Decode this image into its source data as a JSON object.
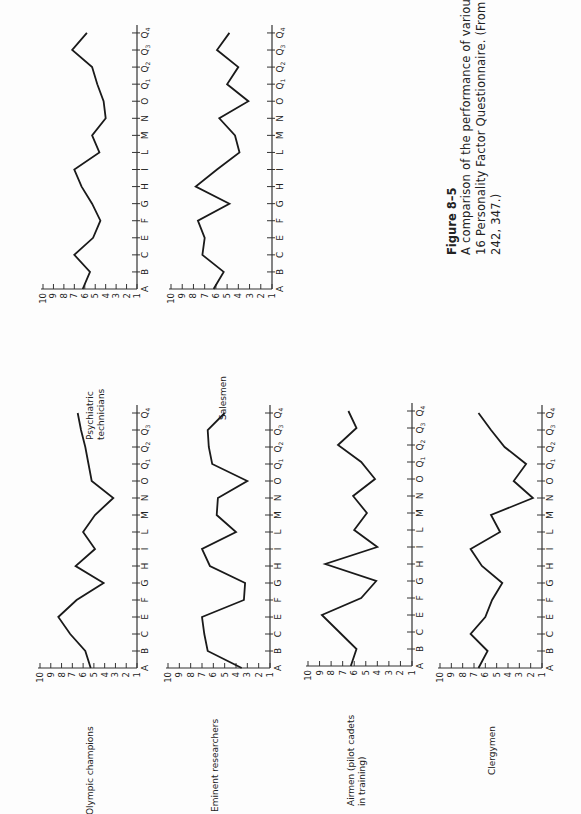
{
  "figure": {
    "label": "Figure 8–5",
    "caption_lines": [
      "A comparison of the performance of various groups on the",
      "16 Personality Factor Questionnaire. (From Cattell 1965, p.",
      "242, 347.)"
    ]
  },
  "chart_data": [
    {
      "type": "line",
      "title": "Psychiatric technicians",
      "categories": [
        "A",
        "B",
        "C",
        "E",
        "F",
        "G",
        "H",
        "I",
        "L",
        "M",
        "N",
        "O",
        "Q1",
        "Q2",
        "Q3",
        "Q4"
      ],
      "values": [
        6.2,
        5.5,
        7.0,
        5.2,
        4.5,
        5.3,
        6.3,
        7.0,
        4.6,
        5.3,
        4.0,
        4.2,
        4.8,
        5.3,
        7.2,
        5.8
      ],
      "xlabel": "16PF factor",
      "ylabel": "Sten score",
      "ylim": [
        1,
        10
      ],
      "yticks": [
        "1",
        "2",
        "3",
        "4",
        "5",
        "6",
        "7",
        "8",
        "9",
        "10"
      ],
      "layout": {
        "x10": 43,
        "x1": 137,
        "yA": 289,
        "step": 17.07
      }
    },
    {
      "type": "line",
      "title": "Salesmen",
      "categories": [
        "A",
        "B",
        "C",
        "E",
        "F",
        "G",
        "H",
        "I",
        "L",
        "M",
        "N",
        "O",
        "Q1",
        "Q2",
        "Q3",
        "Q4"
      ],
      "values": [
        6.2,
        5.3,
        7.2,
        7.0,
        7.6,
        4.8,
        7.8,
        5.9,
        3.9,
        4.3,
        5.7,
        3.1,
        5.0,
        4.0,
        5.9,
        4.8
      ],
      "xlabel": "16PF factor",
      "ylabel": "Sten score",
      "ylim": [
        1,
        10
      ],
      "yticks": [
        "1",
        "2",
        "3",
        "4",
        "5",
        "6",
        "7",
        "8",
        "9",
        "10"
      ],
      "layout": {
        "x10": 171,
        "x1": 272,
        "yA": 289,
        "step": 17.07
      }
    },
    {
      "type": "line",
      "title": "Olympic champions",
      "categories": [
        "A",
        "B",
        "C",
        "E",
        "F",
        "G",
        "H",
        "I",
        "L",
        "M",
        "N",
        "O",
        "Q1",
        "Q2",
        "Q3",
        "Q4"
      ],
      "values": [
        5.3,
        5.8,
        7.2,
        8.3,
        6.6,
        4.1,
        6.7,
        4.9,
        6.0,
        4.9,
        3.2,
        5.2,
        5.5,
        5.8,
        6.2,
        6.5
      ],
      "xlabel": "16PF factor",
      "ylabel": "Sten score",
      "ylim": [
        1,
        10
      ],
      "yticks": [
        "1",
        "2",
        "3",
        "4",
        "5",
        "6",
        "7",
        "8",
        "9",
        "10"
      ],
      "layout": {
        "x10": 40,
        "x1": 137,
        "yA": 668,
        "step": 17.0
      }
    },
    {
      "type": "line",
      "title": "Eminent researchers",
      "categories": [
        "A",
        "B",
        "C",
        "E",
        "F",
        "G",
        "H",
        "I",
        "L",
        "M",
        "N",
        "O",
        "Q1",
        "Q2",
        "Q3",
        "Q4"
      ],
      "values": [
        3.5,
        6.5,
        6.8,
        7.0,
        3.3,
        3.2,
        6.3,
        7.0,
        4.0,
        5.7,
        5.6,
        3.0,
        6.1,
        6.4,
        6.5,
        5.0
      ],
      "xlabel": "16PF factor",
      "ylabel": "Sten score",
      "ylim": [
        1,
        10
      ],
      "yticks": [
        "1",
        "2",
        "3",
        "4",
        "5",
        "6",
        "7",
        "8",
        "9",
        "10"
      ],
      "layout": {
        "x10": 168,
        "x1": 270,
        "yA": 668,
        "step": 17.0
      }
    },
    {
      "type": "line",
      "title": "Airmen (pilot cadets in training)",
      "categories": [
        "A",
        "B",
        "C",
        "E",
        "F",
        "G",
        "H",
        "I",
        "L",
        "M",
        "N",
        "O",
        "Q1",
        "Q2",
        "Q3",
        "Q4"
      ],
      "values": [
        6.3,
        5.8,
        7.3,
        8.8,
        5.4,
        4.1,
        8.5,
        4.0,
        6.0,
        4.9,
        6.1,
        4.2,
        5.4,
        7.4,
        5.8,
        6.5
      ],
      "xlabel": "16PF factor",
      "ylabel": "Sten score",
      "ylim": [
        1,
        10
      ],
      "yticks": [
        "1",
        "2",
        "3",
        "4",
        "5",
        "6",
        "7",
        "8",
        "9",
        "10"
      ],
      "layout": {
        "x10": 308,
        "x1": 412,
        "yA": 666,
        "step": 17.0
      }
    },
    {
      "type": "line",
      "title": "Clergymen",
      "categories": [
        "A",
        "B",
        "C",
        "E",
        "F",
        "G",
        "H",
        "I",
        "L",
        "M",
        "N",
        "O",
        "Q1",
        "Q2",
        "Q3",
        "Q4"
      ],
      "values": [
        6.6,
        5.8,
        7.3,
        6.0,
        5.4,
        4.5,
        6.3,
        7.3,
        4.7,
        5.5,
        1.8,
        3.5,
        2.4,
        4.3,
        5.5,
        6.6
      ],
      "xlabel": "16PF factor",
      "ylabel": "Sten score",
      "ylim": [
        1,
        10
      ],
      "yticks": [
        "1",
        "2",
        "3",
        "4",
        "5",
        "6",
        "7",
        "8",
        "9",
        "10"
      ],
      "layout": {
        "x10": 440,
        "x1": 542,
        "yA": 668,
        "step": 17.0
      }
    }
  ],
  "group_labels": [
    {
      "lines": [
        "Psychiatric",
        "technicians"
      ],
      "x": 93,
      "y": 440
    },
    {
      "lines": [
        "Salesmen"
      ],
      "x": 226,
      "y": 420
    },
    {
      "lines": [
        "Olympic champions"
      ],
      "x": 93,
      "y": 815
    },
    {
      "lines": [
        "Eminent researchers"
      ],
      "x": 218,
      "y": 812
    },
    {
      "lines": [
        "Airmen (pilot cadets",
        "in training)"
      ],
      "x": 354,
      "y": 806
    },
    {
      "lines": [
        "Clergymen"
      ],
      "x": 495,
      "y": 775
    }
  ]
}
